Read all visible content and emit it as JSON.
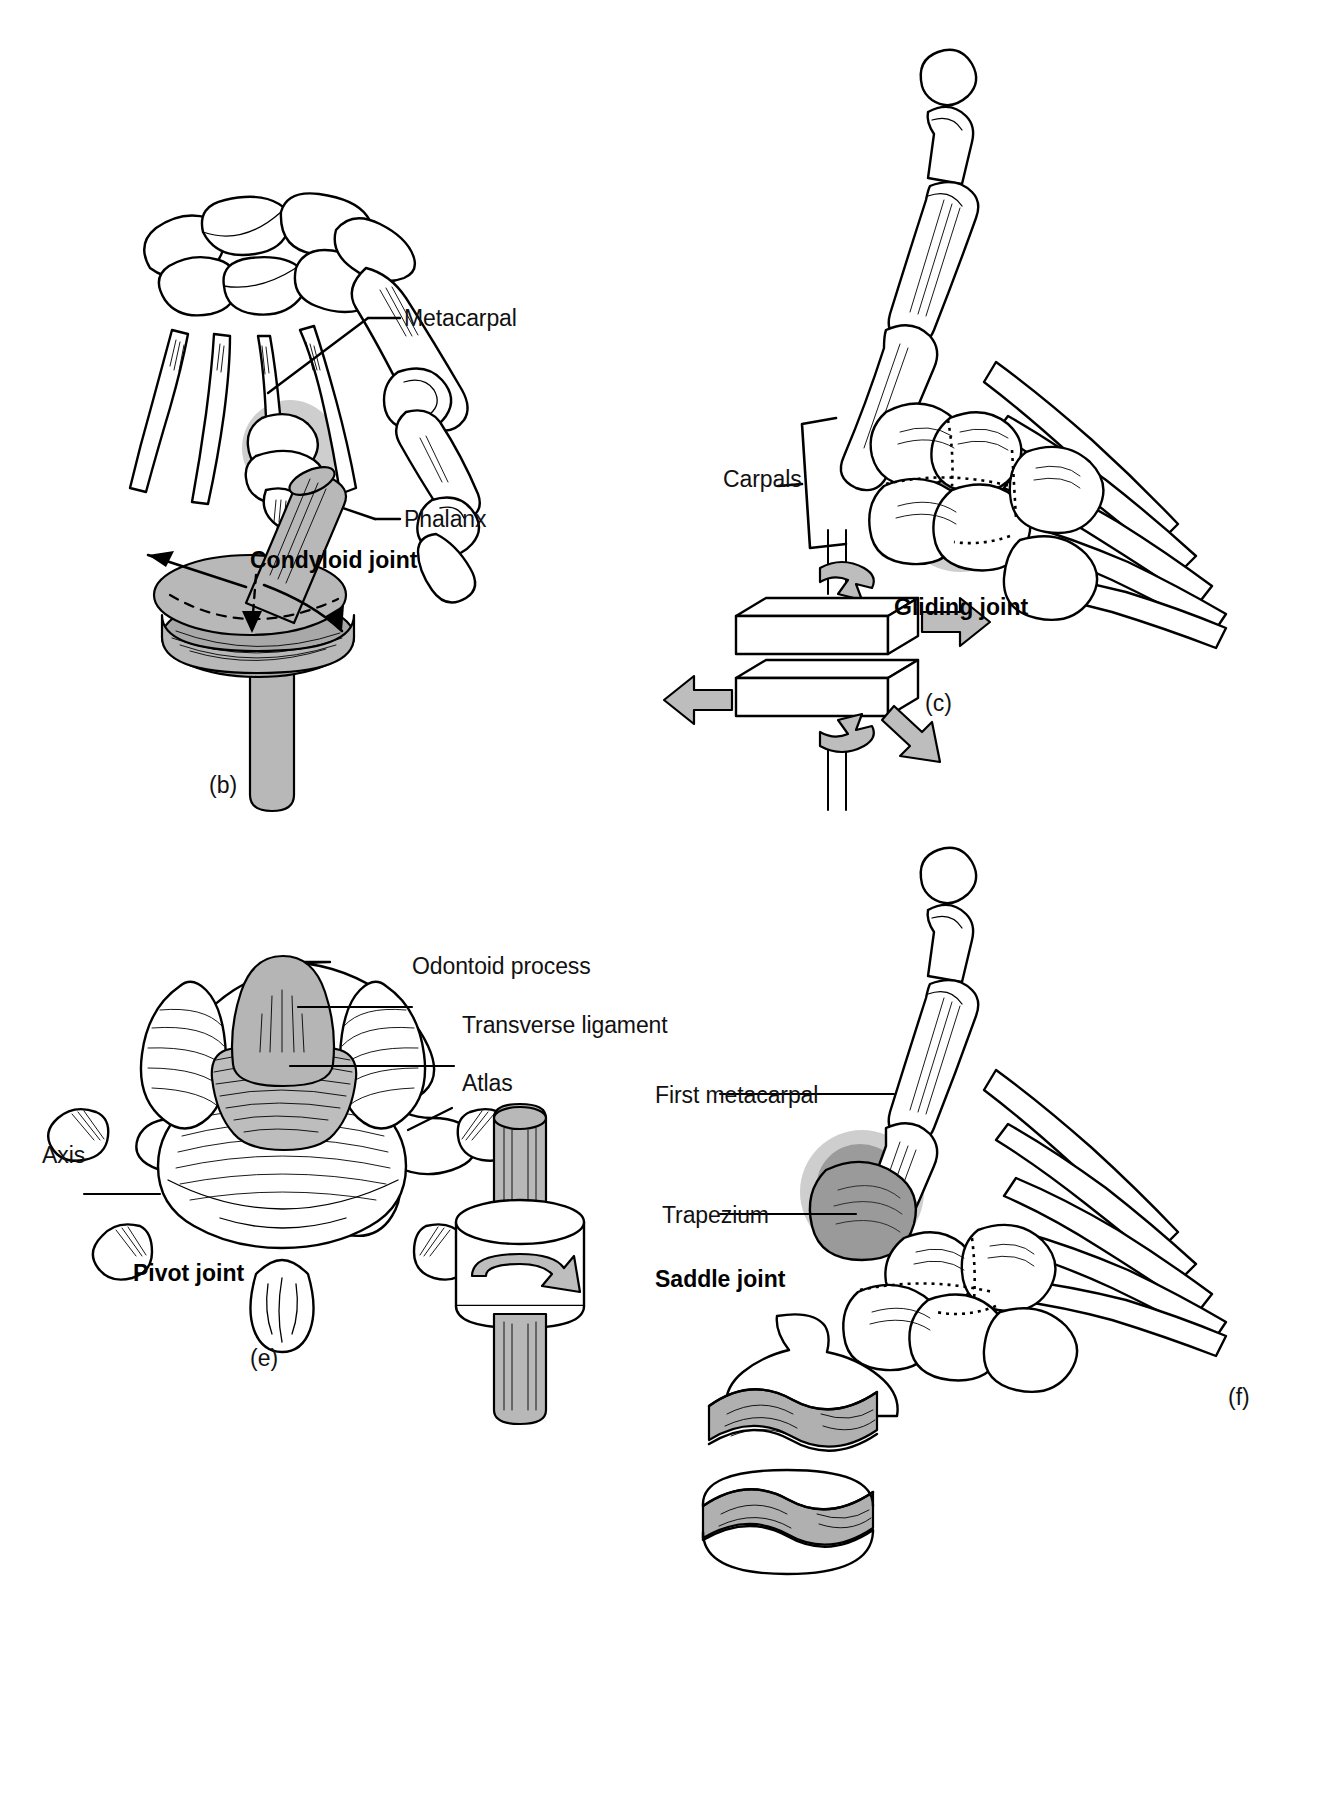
{
  "figure": {
    "background_color": "#ffffff",
    "ink_color": "#000000",
    "highlight_color": "#c6c6c6",
    "model_fill_color": "#b8b8b8"
  },
  "panels": [
    {
      "id": "b",
      "letter": "(b)",
      "caption": "Condyloid joint",
      "subject": "hand skeleton, metacarpophalangeal joint",
      "labels": [
        {
          "text": "Metacarpal",
          "name": "label-metacarpal"
        },
        {
          "text": "Phalanx",
          "name": "label-phalanx"
        }
      ],
      "model": "ellipsoid-in-socket with motion arrows"
    },
    {
      "id": "c",
      "letter": "(c)",
      "caption": "Gliding joint",
      "subject": "hand skeleton, intercarpal joints",
      "labels": [
        {
          "text": "Carpals",
          "name": "label-carpals"
        }
      ],
      "model": "two flat slabs sliding on each other with arrows"
    },
    {
      "id": "e",
      "letter": "(e)",
      "caption": "Pivot joint",
      "subject": "atlas and axis vertebrae, superior view",
      "labels": [
        {
          "text": "Odontoid process",
          "name": "label-odontoid-process"
        },
        {
          "text": "Transverse ligament",
          "name": "label-transverse-ligament"
        },
        {
          "text": "Atlas",
          "name": "label-atlas"
        },
        {
          "text": "Axis",
          "name": "label-axis"
        }
      ],
      "model": "peg rotating inside a ring with a curved arrow"
    },
    {
      "id": "f",
      "letter": "(f)",
      "caption": "Saddle joint",
      "subject": "hand skeleton, first carpometacarpal joint",
      "labels": [
        {
          "text": "First metacarpal",
          "name": "label-first-metacarpal"
        },
        {
          "text": "Trapezium",
          "name": "label-trapezium"
        }
      ],
      "model": "two interlocking saddle-shaped surfaces"
    }
  ]
}
